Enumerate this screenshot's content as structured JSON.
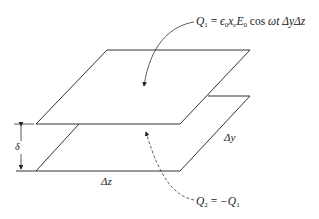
{
  "diagram": {
    "labels": {
      "q1_formula": "Q₁ = ϵ₀xₑE₀ cos ωt ΔyΔz",
      "q1_sym": "Q",
      "q1_sub": "1",
      "q1_rhs_eps": "ϵ",
      "q1_rhs_eps_sub": "0",
      "q1_rhs_x": "x",
      "q1_rhs_x_sub": "e",
      "q1_rhs_E": "E",
      "q1_rhs_E_sub": "0",
      "q1_rhs_tail_fn": "cos",
      "q1_rhs_tail_arg": "ωt",
      "q1_rhs_dy": "Δy",
      "q1_rhs_dz": "Δz",
      "equals": "=",
      "q2_formula": "Q₂ = −Q₁",
      "q2_sym": "Q",
      "q2_sub": "2",
      "q2_rhs": "−Q",
      "q2_rhs_sub": "1",
      "delta_y": "Δy",
      "delta_z": "Δz",
      "delta": "δ"
    },
    "colors": {
      "line": "#222222",
      "background": "#ffffff"
    }
  }
}
